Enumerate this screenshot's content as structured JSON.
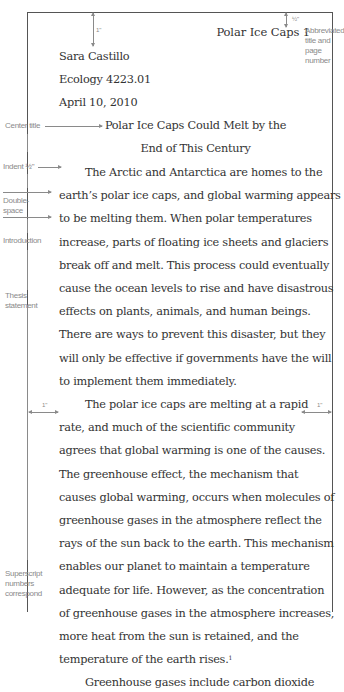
{
  "running_head": "Polar Ice Caps 1",
  "heading": {
    "name": "Sara Castillo",
    "course": "Ecology 4223.01",
    "date": "April 10, 2010"
  },
  "title": {
    "line1": "Polar Ice Caps Could Melt by the",
    "line2": "End of This Century"
  },
  "paragraphs": [
    {
      "lines": [
        "The Arctic and Antarctica are homes to the",
        "earth’s polar ice caps, and global warming appears",
        "to be melting them. When polar temperatures",
        "increase, parts of floating ice sheets and glaciers",
        "break off and melt. This process could eventually",
        "cause the ocean levels to rise and have disastrous",
        "effects on plants, animals, and human beings.",
        "There are ways to prevent this disaster, but they",
        "will only be effective if governments have the will",
        "to implement them immediately."
      ]
    },
    {
      "lines": [
        "The polar ice caps are melting at a rapid",
        "rate, and much of the scientific community",
        "agrees that global warming is one of the causes.",
        "The greenhouse effect, the mechanism that",
        "causes global warming, occurs when molecules of",
        "greenhouse gases in the atmosphere reflect the",
        "rays of the sun back to the earth. This mechanism",
        "enables our planet to maintain a temperature",
        "adequate for life. However, as the concentration",
        "of greenhouse gases in the atmosphere increases,",
        "more heat from the sun is retained, and the",
        "temperature of the earth rises."
      ],
      "footnote_ref": "1"
    },
    {
      "lines": [
        "Greenhouse gases include carbon dioxide"
      ]
    }
  ],
  "annotations": {
    "top_margin": "1\"",
    "header_margin": "½\"",
    "abbreviated_title": [
      "Abbreviated",
      "title and",
      "page",
      "number"
    ],
    "center_title": "Center title",
    "indent": "Indent ½\"",
    "double_space": [
      "Double-",
      "space"
    ],
    "introduction": "Introduction",
    "thesis": [
      "Thesis",
      "statement"
    ],
    "left_margin": "1\"",
    "right_margin": "1\"",
    "superscript": [
      "Superscript",
      "numbers",
      "correspond"
    ]
  }
}
